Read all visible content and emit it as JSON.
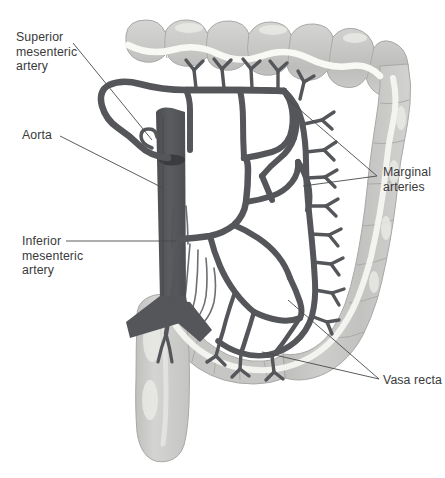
{
  "figure": {
    "background_color": "#ffffff"
  },
  "palette": {
    "artery": "#54565a",
    "artery_dark": "#4a4c50",
    "aorta_fill": "#55575b",
    "colon_fill": "#c9c9c9",
    "colon_shade": "#b4b4b4",
    "colon_highlight": "#f2f2f0",
    "taenia": "#fbfbf8",
    "outline": "#9a9a9a",
    "label_text": "#3a3a3c",
    "leader_line": "#4a4a4c"
  },
  "labels": [
    {
      "id": "superior-mesenteric-artery",
      "text": "Superior\nmesenteric\nartery",
      "x": 16,
      "y": 30,
      "leaders": [
        {
          "x1": 73,
          "y1": 43,
          "x2": 152,
          "y2": 140
        }
      ]
    },
    {
      "id": "aorta",
      "text": "Aorta",
      "x": 22,
      "y": 128,
      "leaders": [
        {
          "x1": 60,
          "y1": 136,
          "x2": 163,
          "y2": 188
        }
      ]
    },
    {
      "id": "inferior-mesenteric-artery",
      "text": "Inferior\nmesenteric\nartery",
      "x": 22,
      "y": 234,
      "leaders": [
        {
          "x1": 66,
          "y1": 241,
          "x2": 176,
          "y2": 241
        }
      ]
    },
    {
      "id": "marginal-arteries",
      "text": "Marginal\narteries",
      "x": 383,
      "y": 165,
      "leaders": [
        {
          "x1": 377,
          "y1": 176,
          "x2": 284,
          "y2": 96
        },
        {
          "x1": 377,
          "y1": 176,
          "x2": 303,
          "y2": 186
        }
      ]
    },
    {
      "id": "vasa-recta",
      "text": "Vasa recta",
      "x": 383,
      "y": 373,
      "leaders": [
        {
          "x1": 379,
          "y1": 379,
          "x2": 288,
          "y2": 300
        },
        {
          "x1": 379,
          "y1": 379,
          "x2": 262,
          "y2": 352
        }
      ]
    }
  ],
  "anatomy": {
    "structures": [
      "transverse colon",
      "descending colon",
      "sigmoid colon",
      "rectum",
      "abdominal aorta",
      "superior mesenteric artery",
      "inferior mesenteric artery",
      "marginal artery",
      "vasa recta",
      "arterial arcades",
      "common iliac arteries",
      "superior rectal artery"
    ]
  }
}
